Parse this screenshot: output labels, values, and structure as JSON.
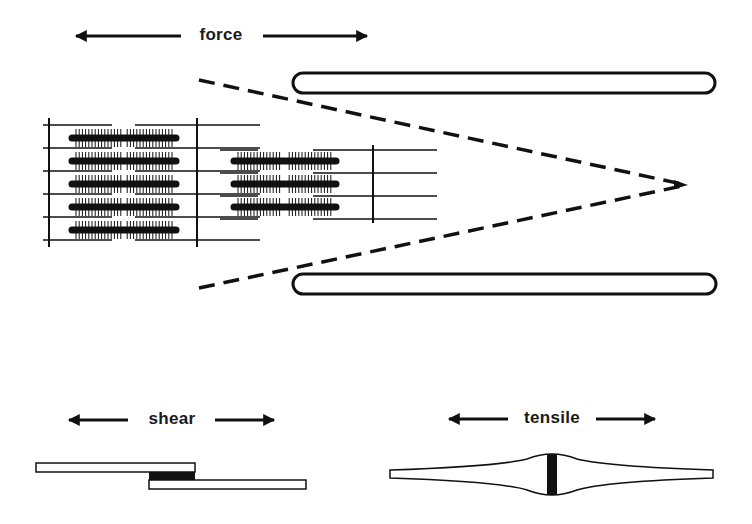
{
  "colors": {
    "ink": "#111111",
    "background": "#ffffff"
  },
  "labels": {
    "force": "force",
    "shear": "shear",
    "tensile": "tensile"
  },
  "force_arrows": {
    "y": 36,
    "left": {
      "x1": 181,
      "x2": 76
    },
    "right": {
      "x1": 263,
      "x2": 367
    },
    "label_x": 221
  },
  "shear_arrows": {
    "y": 420,
    "left": {
      "x1": 128,
      "x2": 69
    },
    "right": {
      "x1": 215,
      "x2": 274
    },
    "label_x": 172
  },
  "tensile_arrows": {
    "y": 419,
    "left": {
      "x1": 508,
      "x2": 449
    },
    "right": {
      "x1": 596,
      "x2": 655
    },
    "label_x": 552
  },
  "sarcomere_left": {
    "z_lines_x": [
      49,
      197
    ],
    "z_line_y": [
      118,
      247
    ],
    "thin_lines_y": [
      125,
      148,
      171,
      194,
      217,
      240
    ],
    "thin_segments": [
      [
        43,
        112
      ],
      [
        135,
        260
      ]
    ],
    "thick_filaments_y": [
      138,
      161,
      184,
      207,
      230
    ],
    "thick_x": [
      72,
      176
    ]
  },
  "sarcomere_right": {
    "z_line_x": 373,
    "z_line_y": [
      145,
      223
    ],
    "thin_lines_y": [
      150,
      173,
      196,
      219
    ],
    "thin_segments": [
      [
        220,
        258
      ],
      [
        313,
        437
      ]
    ],
    "thick_filaments_y": [
      161,
      184,
      207
    ],
    "thick_x": [
      234,
      336
    ]
  },
  "magnification_lines": {
    "apex": [
      688,
      185
    ],
    "top_start": [
      199,
      80
    ],
    "bottom_start": [
      199,
      288
    ]
  },
  "capsules": [
    {
      "name": "top",
      "x": 293,
      "y": 73,
      "w": 422,
      "h": 20
    },
    {
      "name": "bottom",
      "x": 293,
      "y": 274,
      "w": 423,
      "h": 20
    }
  ],
  "shear_specimen": {
    "top_bar": {
      "x": 36,
      "y": 463,
      "w": 159,
      "h": 9
    },
    "adhesive": {
      "x": 149,
      "y": 472,
      "w": 46,
      "h": 8
    },
    "bottom_bar": {
      "x": 149,
      "y": 480,
      "w": 157,
      "h": 9
    }
  },
  "tensile_specimen": {
    "x_start": 390,
    "x_end": 713,
    "center_x": 552,
    "end_top": 470,
    "end_bottom": 478,
    "bulge_top": 454,
    "bulge_bottom": 495,
    "bond_width": 10
  }
}
